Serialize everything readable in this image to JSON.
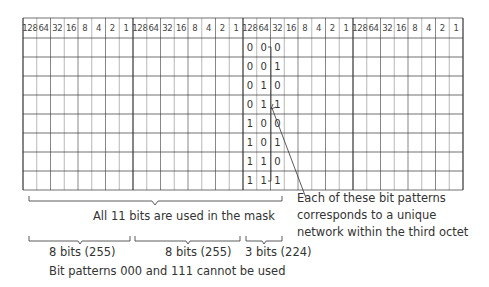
{
  "grid": {
    "octets": 4,
    "bits_per_octet": 8,
    "header_values": [
      "128",
      "64",
      "32",
      "16",
      "8",
      "4",
      "2",
      "1"
    ],
    "data_rows": 8,
    "highlight_octet_index": 2,
    "highlight_bit_count": 3
  },
  "bit_patterns": [
    [
      "0",
      "0",
      "0"
    ],
    [
      "0",
      "0",
      "1"
    ],
    [
      "0",
      "1",
      "0"
    ],
    [
      "0",
      "1",
      "1"
    ],
    [
      "1",
      "0",
      "0"
    ],
    [
      "1",
      "0",
      "1"
    ],
    [
      "1",
      "1",
      "0"
    ],
    [
      "1",
      "1",
      "1"
    ]
  ],
  "annotations": {
    "mask_total": "All 11 bits are used in the mask",
    "octet1": "8 bits (255)",
    "octet2": "8 bits (255)",
    "octet3": "3 bits (224)",
    "restriction": "Bit patterns 000 and 111 cannot be used",
    "callout_line1": "Each of these bit patterns",
    "callout_line2": "corresponds to a unique",
    "callout_line3": "network within the third octet"
  },
  "colors": {
    "grid_line": "#333333",
    "light_line": "#9a9a9a",
    "text": "#333333"
  }
}
